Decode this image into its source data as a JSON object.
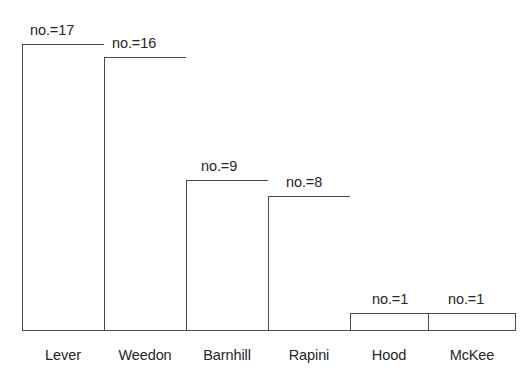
{
  "chart_data": {
    "type": "bar",
    "title": "",
    "subtitle": "",
    "xlabel": "",
    "ylabel": "",
    "grid": false,
    "legend": "none",
    "axis_visible": "baseline-only",
    "orientation": "vertical",
    "bar_style": "outlined",
    "categories": [
      "Lever",
      "Weedon",
      "Barnhill",
      "Rapini",
      "Hood",
      "McKee"
    ],
    "values": [
      17,
      16,
      9,
      8,
      1,
      1
    ],
    "value_label_prefix": "no.=",
    "data_labels": [
      "no.=17",
      "no.=16",
      "no.=9",
      "no.=8",
      "no.=1",
      "no.=1"
    ],
    "ylim": [
      0,
      17
    ],
    "bars": [
      {
        "category": "Lever",
        "value": 17,
        "label": "no.=17",
        "x": 22,
        "width": 82,
        "top": 44,
        "height": 287,
        "label_x": 30,
        "label_y": 23,
        "cat_label_x": 22,
        "cat_label_width": 82,
        "cat_label_y": 348
      },
      {
        "category": "Weedon",
        "value": 16,
        "label": "no.=16",
        "x": 104,
        "width": 82,
        "top": 57,
        "height": 274,
        "label_x": 112,
        "label_y": 36,
        "cat_label_x": 104,
        "cat_label_width": 82,
        "cat_label_y": 348
      },
      {
        "category": "Barnhill",
        "value": 9,
        "label": "no.=9",
        "x": 186,
        "width": 82,
        "top": 180,
        "height": 151,
        "label_x": 201,
        "label_y": 159,
        "cat_label_x": 186,
        "cat_label_width": 82,
        "cat_label_y": 348
      },
      {
        "category": "Rapini",
        "value": 8,
        "label": "no.=8",
        "x": 268,
        "width": 82,
        "top": 196,
        "height": 135,
        "label_x": 286,
        "label_y": 175,
        "cat_label_x": 268,
        "cat_label_width": 82,
        "cat_label_y": 348
      },
      {
        "category": "Hood",
        "value": 1,
        "label": "no.=1",
        "x": 350,
        "width": 78,
        "top": 313,
        "height": 18,
        "label_x": 372,
        "label_y": 292,
        "cat_label_x": 350,
        "cat_label_width": 78,
        "cat_label_y": 348
      },
      {
        "category": "McKee",
        "value": 1,
        "label": "no.=1",
        "x": 428,
        "width": 88,
        "top": 313,
        "height": 18,
        "label_x": 448,
        "label_y": 292,
        "cat_label_x": 428,
        "cat_label_width": 88,
        "cat_label_y": 348
      }
    ],
    "colors": {
      "background": "#ffffff",
      "bar_fill": "#ffffff",
      "bar_stroke": "#4a4a4a",
      "text": "#262626"
    }
  }
}
